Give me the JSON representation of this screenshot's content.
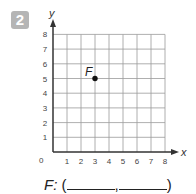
{
  "problem": {
    "number": "2",
    "answer_label": "F:",
    "open_paren": "(",
    "comma": ",",
    "close_paren": ")"
  },
  "colors": {
    "badge": "#b5b5b5",
    "grid": "#9a9a9a",
    "axis": "#333333",
    "point": "#111111"
  },
  "chart_data": {
    "type": "scatter",
    "title": "",
    "xlabel": "x",
    "ylabel": "y",
    "xlim": [
      0,
      8
    ],
    "ylim": [
      0,
      8
    ],
    "x_ticks": [
      "1",
      "2",
      "3",
      "4",
      "5",
      "6",
      "7",
      "8"
    ],
    "y_ticks": [
      "1",
      "2",
      "3",
      "4",
      "5",
      "6",
      "7",
      "8"
    ],
    "origin_label": "0",
    "grid": true,
    "points": [
      {
        "label": "F",
        "x": 3,
        "y": 5
      }
    ]
  }
}
